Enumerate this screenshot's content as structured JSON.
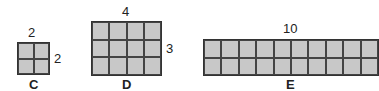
{
  "shapes": [
    {
      "id": "C",
      "name": "C",
      "width_label": "2",
      "height_label": "2",
      "cols": 2,
      "rows": 2
    },
    {
      "id": "D",
      "name": "D",
      "width_label": "4",
      "height_label": "3",
      "cols": 4,
      "rows": 3
    },
    {
      "id": "E",
      "name": "E",
      "width_label": "10",
      "height_label": "",
      "cols": 10,
      "rows": 2
    }
  ],
  "colors": {
    "fill": "#c8c8c8",
    "line": "#333333"
  }
}
